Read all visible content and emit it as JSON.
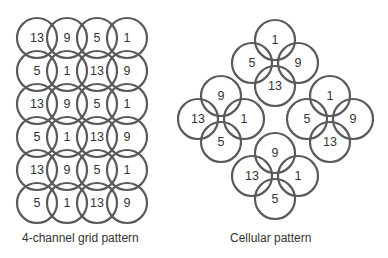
{
  "grid": {
    "caption": "4-channel grid pattern",
    "rows": [
      [
        "13",
        "9",
        "5",
        "1"
      ],
      [
        "5",
        "1",
        "13",
        "9"
      ],
      [
        "13",
        "9",
        "5",
        "1"
      ],
      [
        "5",
        "1",
        "13",
        "9"
      ],
      [
        "13",
        "9",
        "5",
        "1"
      ],
      [
        "5",
        "1",
        "13",
        "9"
      ]
    ]
  },
  "cellular": {
    "caption": "Cellular pattern",
    "clusters": [
      {
        "top": "1",
        "left": "5",
        "right": "9",
        "bottom": "13"
      },
      {
        "top": "9",
        "left": "13",
        "right": "1",
        "bottom": "5"
      },
      {
        "top": "1",
        "left": "5",
        "right": "9",
        "bottom": "13"
      },
      {
        "top": "9",
        "left": "13",
        "right": "1",
        "bottom": "5"
      }
    ]
  },
  "colors": {
    "stroke": "#5a5a5a",
    "text": "#333333"
  }
}
